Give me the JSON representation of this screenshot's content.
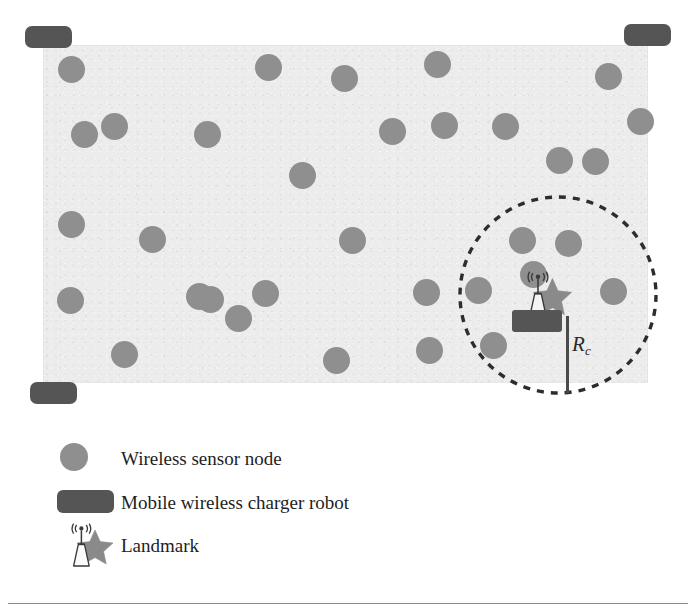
{
  "figure": {
    "canvas": {
      "width": 696,
      "height": 614,
      "background": "#ffffff"
    },
    "field": {
      "name": "sensor-deployment-field",
      "x": 43,
      "y": 45,
      "width": 605,
      "height": 338,
      "color": "#ececec"
    },
    "colors": {
      "node": "#8f8f8f",
      "charger": "#555555",
      "field": "#ececec",
      "dash": "#2d2d2d",
      "star": "#8a8a8a",
      "tower": "#f4f4f4",
      "text": "#1e1e1e"
    }
  },
  "sensor_nodes": {
    "label": "Wireless sensor node",
    "count": 33,
    "diameter": 27,
    "positions": [
      [
        71,
        69
      ],
      [
        268,
        67
      ],
      [
        344,
        78
      ],
      [
        437,
        64
      ],
      [
        608,
        76
      ],
      [
        84,
        134
      ],
      [
        114,
        126
      ],
      [
        207,
        134
      ],
      [
        302,
        175
      ],
      [
        392,
        131
      ],
      [
        444,
        125
      ],
      [
        505,
        126
      ],
      [
        559,
        160
      ],
      [
        71,
        224
      ],
      [
        152,
        239
      ],
      [
        210,
        299
      ],
      [
        265,
        293
      ],
      [
        352,
        240
      ],
      [
        426,
        292
      ],
      [
        493,
        345
      ],
      [
        522,
        240
      ],
      [
        568,
        243
      ],
      [
        613,
        291
      ],
      [
        70,
        300
      ],
      [
        124,
        354
      ],
      [
        199,
        296
      ],
      [
        238,
        318
      ],
      [
        336,
        360
      ],
      [
        429,
        350
      ],
      [
        478,
        290
      ],
      [
        533,
        274
      ],
      [
        595,
        161
      ],
      [
        640,
        121
      ]
    ]
  },
  "chargers": {
    "label": "Mobile wireless charger robot",
    "positions": [
      {
        "name": "charger-top-left",
        "x": 25,
        "y": 26,
        "width": 47,
        "height": 22
      },
      {
        "name": "charger-top-right",
        "x": 624,
        "y": 24,
        "width": 47,
        "height": 22
      },
      {
        "name": "charger-bottom-left",
        "x": 30,
        "y": 382,
        "width": 47,
        "height": 22
      }
    ]
  },
  "charging_range": {
    "name": "charging-range-circle",
    "center_x": 558,
    "center_y": 295,
    "radius": 98,
    "style": "dashed",
    "label": "R",
    "label_sub": "c",
    "label_x": 572,
    "label_y": 334
  },
  "landmark": {
    "label": "Landmark",
    "x": 512,
    "y": 270,
    "robot_body": {
      "x": 512,
      "y": 310,
      "width": 50,
      "height": 22
    }
  },
  "legend": {
    "name": "figure-legend",
    "items": [
      {
        "id": "legend-sensor-node",
        "icon": "circle-icon",
        "label": "Wireless sensor node"
      },
      {
        "id": "legend-charger-robot",
        "icon": "rectangle-icon",
        "label": "Mobile wireless charger robot"
      },
      {
        "id": "legend-landmark",
        "icon": "landmark-icon",
        "label": "Landmark"
      }
    ]
  }
}
